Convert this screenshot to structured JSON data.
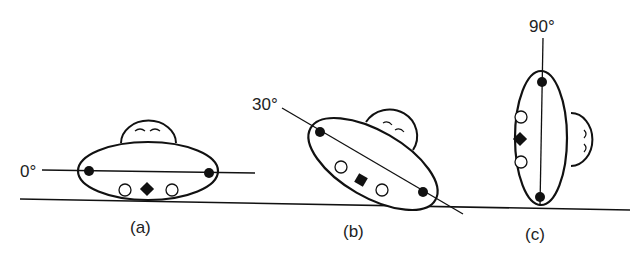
{
  "figure": {
    "panels": [
      {
        "id": "a",
        "caption": "(a)",
        "angle_label": "0°",
        "angle": 0
      },
      {
        "id": "b",
        "caption": "(b)",
        "angle_label": "30°",
        "angle": 30
      },
      {
        "id": "c",
        "caption": "(c)",
        "angle_label": "90°",
        "angle": 90
      }
    ],
    "elements": {
      "ground_line": "ground",
      "body": "ellipse",
      "dome": "half-dome with two arc marks",
      "filled_markers": 2,
      "open_markers": 2,
      "diamond_marker": 1
    },
    "colors": {
      "ink": "#111111",
      "background": "#ffffff"
    }
  }
}
